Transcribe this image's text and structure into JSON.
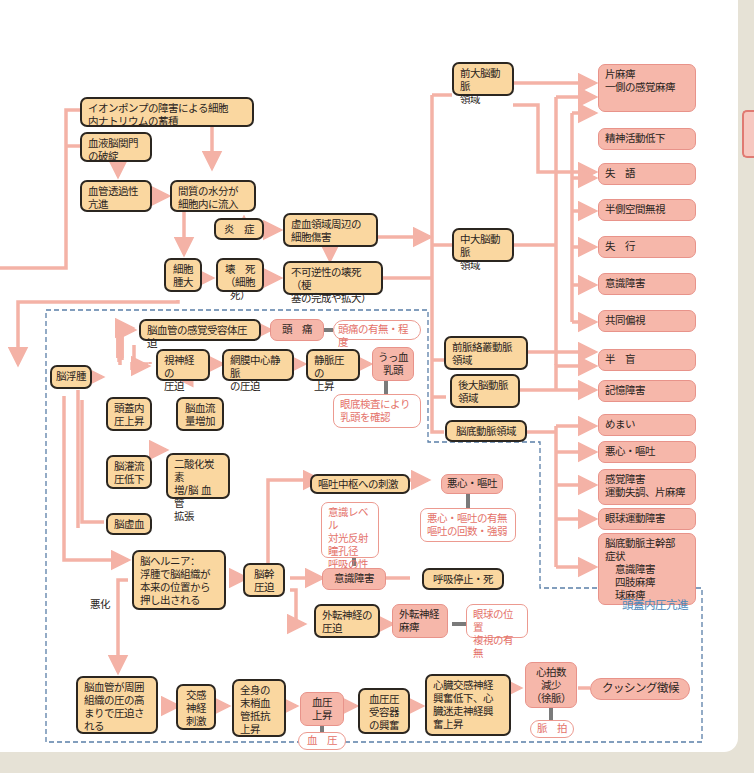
{
  "section_label": "頭蓋内圧亢進",
  "worsening_label": "悪化",
  "nodes": {
    "ion_pump": "イオンポンプの障害による細胞\n内ナトリウムの蓄積",
    "bbb": "血液脳関門\nの破綻",
    "vascular_perm": "血管透過性\n亢進",
    "interstitial_water": "間質の水分が\n細胞内に流入",
    "inflammation": "炎　症",
    "ischemic_injury": "虚血領域周辺の\n細胞傷害",
    "cell_swelling": "細胞\n腫大",
    "necrosis": "壊　死\n（細胞死）",
    "irreversible": "不可逆性の壊死（梗\n塞の完成や拡大）",
    "brain_edema": "脳浮腫",
    "vessel_sensory": "脳血管の感覚受容体圧迫",
    "headache": "頭　痛",
    "headache_obs": "頭痛の有無・程度",
    "optic_comp": "視神経の\n圧迫",
    "retinal_vein": "網膜中心静脈\nの圧迫",
    "venous_pressure": "静脈圧の\n上昇",
    "papilledema": "うっ血\n乳頭",
    "papilledema_obs": "眼底検査により\n乳頭を確認",
    "icp_rise": "頭蓋内\n圧上昇",
    "cbf_increase": "脳血流\n量増加",
    "cpp_decrease": "脳灌流\n圧低下",
    "co2_increase": "二酸化炭素\n増/脳 血 管\n拡張",
    "ischemia": "脳虚血",
    "herniation": "脳ヘルニア：\n浮腫で脳組織が\n本来の位置から\n押し出される",
    "brainstem_comp": "脳幹\n圧迫",
    "vomit_center": "嘔吐中枢への刺激",
    "nausea": "悪心・嘔吐",
    "nausea_obs": "悪心・嘔吐の有無\n嘔吐の回数・強弱",
    "consciousness_obs": "意識レベル\n対光反射\n瞳孔径\n呼吸の性状",
    "consciousness": "意識障害",
    "resp_arrest": "呼吸停止・死",
    "abducens_comp": "外転神経の\n圧迫",
    "abducens_palsy": "外転神経\n麻痺",
    "abducens_obs": "眼球の位置\n複視の有無",
    "vessel_compressed": "脳血管が周囲\n組織の圧の高\nまりで圧迫さ\nれる",
    "sympathetic": "交感\n神経\n刺激",
    "peripheral_resist": "全身の\n末梢血\n管抵抗\n上昇",
    "bp_rise": "血圧\n上昇",
    "bp_obs": "血　圧",
    "baroreceptor": "血圧圧\n受容器\nの興奮",
    "cardiac": "心臓交感神経\n興奮低下、心\n臓迷走神経興\n奮上昇",
    "hr_decrease": "心拍数\n減少\n（徐脈）",
    "pulse_obs": "脈　拍",
    "cushing": "クッシング徴候"
  },
  "territories": {
    "aca": "前大脳動脈\n領域",
    "mca": "中大脳動脈\n領域",
    "acha": "前脈絡叢動脈\n領域",
    "pca": "後大脳動脈\n領域",
    "basilar": "脳底動脈領域"
  },
  "symptoms": [
    "片麻痺\n一側の感覚麻痺",
    "精神活動低下",
    "失　語",
    "半側空間無視",
    "失　行",
    "意識障害",
    "共同偏視",
    "半　盲",
    "記憶障害",
    "めまい",
    "悪心・嘔吐",
    "感覚障害\n運動失調、片麻痺",
    "眼球運動障害",
    "脳底動脈主幹部\n症状\n　意識障害\n　四肢麻痺\n　球麻痺"
  ],
  "colors": {
    "arrow": "#f4b2a6",
    "node_yellow": "#fad7a0",
    "node_pink": "#f6b7aa",
    "observation_text": "#e4726a",
    "dashed_border": "#5a7fa8",
    "section_label": "#4a86b8"
  }
}
